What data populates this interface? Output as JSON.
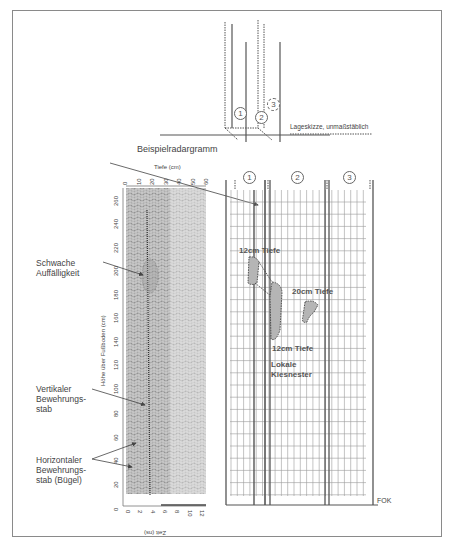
{
  "sketch": {
    "caption": "Lageskizze, unmaßstäblich",
    "markers": [
      "1",
      "2",
      "3"
    ]
  },
  "radargram": {
    "title": "Beispielradargramm",
    "depth_axis_label": "Tiefe (cm)",
    "depth_ticks": [
      "0",
      "10",
      "20",
      "30",
      "40",
      "50",
      "60"
    ],
    "height_axis_label": "Höhe über Fußboden (cm)",
    "height_ticks": [
      "0",
      "20",
      "40",
      "60",
      "80",
      "100",
      "120",
      "140",
      "160",
      "180",
      "200",
      "220",
      "240",
      "260"
    ],
    "time_axis_label": "Zeit (ns)",
    "time_ticks": [
      "0",
      "2",
      "4",
      "6",
      "8",
      "10",
      "12"
    ]
  },
  "annotations": {
    "weak_anomaly": "Schwache Auffälligkeit",
    "vertical_rebar": "Vertikaler Bewehrungs-stab",
    "horizontal_rebar": "Horizontaler Bewehrungs-stab (Bügel)"
  },
  "grid": {
    "columns": [
      "1",
      "2",
      "3"
    ],
    "labels": {
      "depth12_top": "12cm Tiefe",
      "depth20": "20cm Tiefe",
      "depth12_bottom": "12cm Tiefe",
      "gravel_nests": "Lokale Kiesnester",
      "fok": "FOK"
    }
  }
}
